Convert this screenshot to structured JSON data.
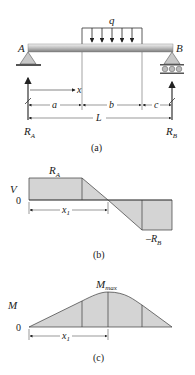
{
  "figure": {
    "panel_a": {
      "caption": "(a)",
      "load_label": "q",
      "support_left_label": "A",
      "support_right_label": "B",
      "reaction_left": "R",
      "reaction_left_sub": "A",
      "reaction_right": "R",
      "reaction_right_sub": "B",
      "x_label": "x",
      "dim_a": "a",
      "dim_b": "b",
      "dim_c": "c",
      "dim_L": "L"
    },
    "panel_b": {
      "caption": "(b)",
      "axis_label": "V",
      "zero_label": "0",
      "top_label": "R",
      "top_label_sub": "A",
      "bottom_label": "–R",
      "bottom_label_sub": "B",
      "x1_label": "x",
      "x1_sub": "1"
    },
    "panel_c": {
      "caption": "(c)",
      "axis_label": "M",
      "zero_label": "0",
      "max_label": "M",
      "max_sub": "max",
      "x1_label": "x",
      "x1_sub": "1"
    },
    "colors": {
      "fill": "#d4d4d4",
      "line": "#3a3a3a",
      "beam_light": "#e6e6e6",
      "beam_dark": "#8a8a8a"
    }
  }
}
